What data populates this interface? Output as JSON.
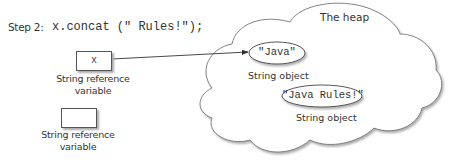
{
  "step": {
    "label": "Step 2:",
    "code": "x.concat (\" Rules!\");"
  },
  "reference_variables": [
    {
      "name": "x",
      "caption_line1": "String reference",
      "caption_line2": "variable"
    },
    {
      "name": "",
      "caption_line1": "String reference",
      "caption_line2": "variable"
    }
  ],
  "heap": {
    "title": "The heap",
    "objects": [
      {
        "value": "\"Java\"",
        "caption": "String object"
      },
      {
        "value": "\"Java Rules!\"",
        "caption": "String object"
      }
    ]
  },
  "colors": {
    "stroke": "#555555",
    "shadow": "#aaaaaa",
    "text": "#333333"
  }
}
